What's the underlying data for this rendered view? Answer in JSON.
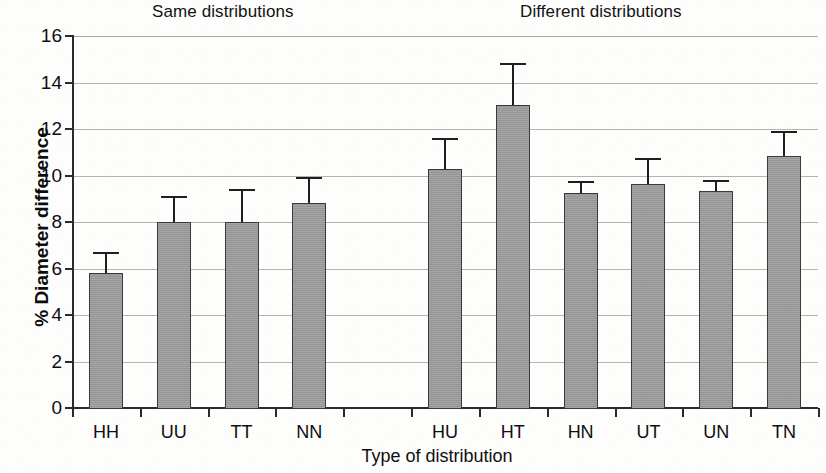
{
  "chart_data": {
    "type": "bar",
    "title": "",
    "xlabel": "Type of distribution",
    "ylabel": "% Diameter difference",
    "ylim": [
      0,
      16
    ],
    "ytick_step": 2,
    "yticks": [
      16,
      14,
      12,
      10,
      8,
      6,
      4,
      2,
      0
    ],
    "grid": true,
    "legend": null,
    "error_bars": "upper-only (single-sided T caps)",
    "bar_color": "#9c9c9c",
    "bar_edge_color": "#3a3a3a",
    "error_bar_color": "#1e1e1e",
    "gridline_color": "#b4b4b0",
    "axis_color": "#2b2b2b",
    "group_headers": [
      {
        "label": "Same distributions",
        "categories": [
          "HH",
          "UU",
          "TT",
          "NN"
        ]
      },
      {
        "label": "Different distributions",
        "categories": [
          "HU",
          "HT",
          "HN",
          "UT",
          "UN",
          "TN"
        ]
      }
    ],
    "categories": [
      "HH",
      "UU",
      "TT",
      "NN",
      "",
      "HU",
      "HT",
      "HN",
      "UT",
      "UN",
      "TN"
    ],
    "values": [
      5.8,
      8.0,
      8.0,
      8.8,
      null,
      10.3,
      13.05,
      9.25,
      9.65,
      9.35,
      10.85
    ],
    "errors": [
      0.9,
      1.1,
      1.4,
      1.15,
      null,
      1.3,
      1.8,
      0.5,
      1.1,
      0.45,
      1.05
    ],
    "points": [
      {
        "category": "HH",
        "value": 5.8,
        "error": 0.9,
        "group": "Same distributions"
      },
      {
        "category": "UU",
        "value": 8.0,
        "error": 1.1,
        "group": "Same distributions"
      },
      {
        "category": "TT",
        "value": 8.0,
        "error": 1.4,
        "group": "Same distributions"
      },
      {
        "category": "NN",
        "value": 8.8,
        "error": 1.15,
        "group": "Same distributions"
      },
      {
        "category": "HU",
        "value": 10.3,
        "error": 1.3,
        "group": "Different distributions"
      },
      {
        "category": "HT",
        "value": 13.05,
        "error": 1.8,
        "group": "Different distributions"
      },
      {
        "category": "HN",
        "value": 9.25,
        "error": 0.5,
        "group": "Different distributions"
      },
      {
        "category": "UT",
        "value": 9.65,
        "error": 1.1,
        "group": "Different distributions"
      },
      {
        "category": "UN",
        "value": 9.35,
        "error": 0.45,
        "group": "Different distributions"
      },
      {
        "category": "TN",
        "value": 10.85,
        "error": 1.05,
        "group": "Different distributions"
      }
    ]
  }
}
